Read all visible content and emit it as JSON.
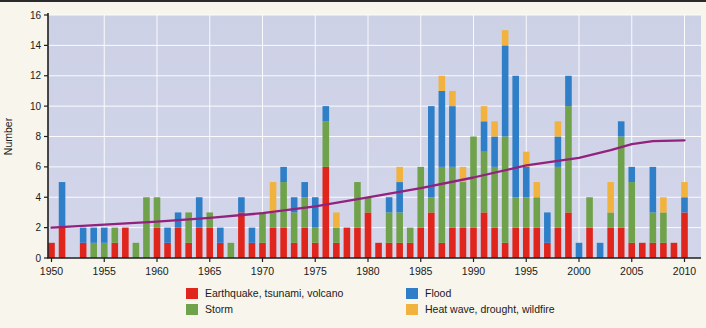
{
  "colors": {
    "plot_bg": "#d3d6ea",
    "plot_bg_top": "#cdd1e6",
    "gridline": "#ffffff",
    "axis": "#1f1f1f",
    "page_bg": "#f7f5ec",
    "trend_line": "#93217e"
  },
  "chart_data": {
    "type": "bar",
    "stacked": true,
    "title": "",
    "xlabel": "",
    "ylabel": "Number",
    "ylim": [
      0,
      16
    ],
    "yticks": [
      0,
      2,
      4,
      6,
      8,
      10,
      12,
      14,
      16
    ],
    "xticks": [
      1950,
      1955,
      1960,
      1965,
      1970,
      1975,
      1980,
      1985,
      1990,
      1995,
      2000,
      2005,
      2010
    ],
    "grid": true,
    "legend_position": "bottom",
    "x_start_year": 1950,
    "years_span": 61,
    "series": [
      {
        "name": "Earthquake, tsunami, volcano",
        "color": "#e0251c",
        "values": [
          1,
          2,
          0,
          1,
          0,
          0,
          1,
          2,
          0,
          0,
          2,
          1,
          2,
          1,
          2,
          2,
          1,
          0,
          3,
          1,
          1,
          2,
          2,
          1,
          2,
          1,
          6,
          1,
          2,
          2,
          3,
          1,
          1,
          1,
          1,
          2,
          3,
          1,
          2,
          2,
          2,
          3,
          2,
          1,
          2,
          2,
          2,
          1,
          2,
          3,
          0,
          2,
          0,
          2,
          2,
          1,
          1,
          1,
          1,
          1,
          3
        ]
      },
      {
        "name": "Storm",
        "color": "#6fa24a",
        "values": [
          0,
          0,
          0,
          0,
          1,
          1,
          1,
          0,
          1,
          4,
          2,
          0,
          0,
          2,
          0,
          1,
          0,
          1,
          0,
          0,
          2,
          1,
          3,
          2,
          2,
          1,
          3,
          1,
          0,
          3,
          1,
          0,
          2,
          2,
          1,
          4,
          1,
          5,
          4,
          3,
          6,
          4,
          4,
          7,
          2,
          2,
          2,
          0,
          4,
          7,
          0,
          2,
          0,
          1,
          6,
          4,
          0,
          2,
          2,
          0,
          0
        ]
      },
      {
        "name": "Flood",
        "color": "#2e7fc8",
        "values": [
          0,
          3,
          0,
          1,
          1,
          1,
          0,
          0,
          0,
          0,
          0,
          1,
          1,
          0,
          2,
          0,
          1,
          0,
          1,
          1,
          0,
          0,
          1,
          1,
          1,
          2,
          1,
          0,
          0,
          0,
          0,
          0,
          1,
          2,
          0,
          0,
          6,
          5,
          4,
          0,
          0,
          2,
          2,
          6,
          8,
          2,
          0,
          2,
          2,
          2,
          1,
          0,
          1,
          0,
          1,
          1,
          0,
          3,
          0,
          0,
          1
        ]
      },
      {
        "name": "Heat wave, drought, wildfire",
        "color": "#f2b33e",
        "values": [
          0,
          0,
          0,
          0,
          0,
          0,
          0,
          0,
          0,
          0,
          0,
          0,
          0,
          0,
          0,
          0,
          0,
          0,
          0,
          0,
          0,
          2,
          0,
          0,
          0,
          0,
          0,
          1,
          0,
          0,
          0,
          0,
          0,
          1,
          0,
          0,
          0,
          1,
          1,
          1,
          0,
          1,
          1,
          1,
          0,
          1,
          1,
          0,
          1,
          0,
          0,
          0,
          0,
          2,
          0,
          0,
          0,
          0,
          1,
          0,
          1
        ]
      }
    ],
    "trend": {
      "name": "trend-line",
      "color": "#93217e",
      "points": [
        [
          1950,
          2.0
        ],
        [
          1955,
          2.2
        ],
        [
          1960,
          2.4
        ],
        [
          1965,
          2.65
        ],
        [
          1970,
          2.95
        ],
        [
          1975,
          3.4
        ],
        [
          1980,
          4.0
        ],
        [
          1985,
          4.6
        ],
        [
          1990,
          5.3
        ],
        [
          1995,
          6.1
        ],
        [
          2000,
          6.6
        ],
        [
          2003,
          7.1
        ],
        [
          2005,
          7.5
        ],
        [
          2007,
          7.7
        ],
        [
          2010,
          7.75
        ]
      ]
    },
    "legend": [
      {
        "label": "Earthquake, tsunami, volcano",
        "series": 0
      },
      {
        "label": "Storm",
        "series": 1
      },
      {
        "label": "Flood",
        "series": 2
      },
      {
        "label": "Heat wave, drought, wildfire",
        "series": 3
      }
    ]
  }
}
